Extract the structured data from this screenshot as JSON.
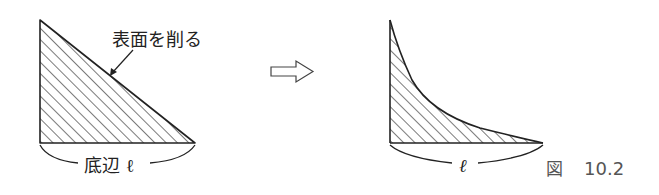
{
  "diagram": {
    "left_figure": {
      "shape": "right-triangle",
      "annotation_label": "表面を削る",
      "base_label": "底辺 ℓ"
    },
    "transition_arrow": {
      "icon": "hollow-right-arrow-icon"
    },
    "right_figure": {
      "shape": "concave-curved-triangle",
      "base_label": "ℓ"
    },
    "caption": {
      "prefix": "図",
      "number": "10.2"
    },
    "colors": {
      "stroke": "#222222",
      "hatch": "#333333",
      "caption": "#555555",
      "background": "#ffffff"
    }
  }
}
